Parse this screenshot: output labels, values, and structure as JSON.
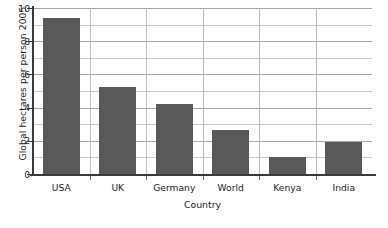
{
  "chart_data": {
    "type": "bar",
    "title": "",
    "categories": [
      "USA",
      "UK",
      "Germany",
      "World",
      "Kenya",
      "India"
    ],
    "values": [
      9.4,
      5.25,
      4.2,
      2.65,
      1.0,
      1.9
    ],
    "xlabel": "Country",
    "ylabel": "Global hectares per person 2005",
    "ylim": [
      0,
      10
    ],
    "yticks": [
      0,
      2,
      4,
      6,
      8,
      10
    ],
    "ytick_labels": [
      "0",
      "2",
      "4",
      "6",
      "8",
      "10"
    ],
    "minor_gridline_step": 1,
    "grid": "horizontal-and-vertical",
    "legend": "none",
    "bar_color": "#595959",
    "gridline_color": "#c9c9c9",
    "axis_color": "#3b3b3b",
    "background_color": "#ffffff"
  }
}
